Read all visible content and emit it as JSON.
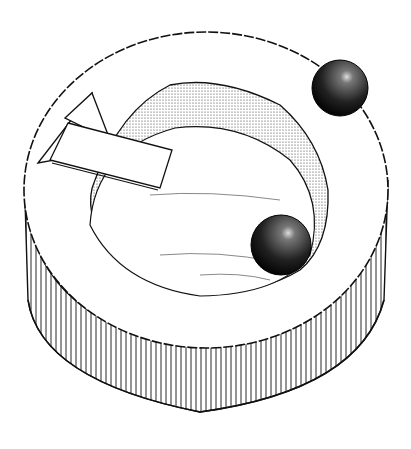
{
  "figure": {
    "colors": {
      "ink": "#111111",
      "paper": "#ffffff"
    },
    "elements": [
      "ring-top",
      "ring-side",
      "inner-hollow",
      "sphere-top-right",
      "sphere-inner",
      "bracket"
    ]
  }
}
